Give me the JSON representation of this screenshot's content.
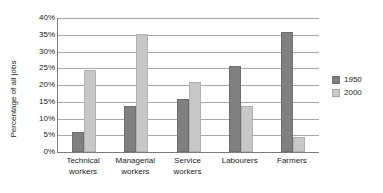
{
  "chart_data": {
    "type": "bar",
    "title": "",
    "subtitle": "",
    "xlabel": "",
    "ylabel": "Percentage of all jobs",
    "ylim": [
      0,
      40
    ],
    "ytick_labels": [
      "0%",
      "5%",
      "10%",
      "15%",
      "20%",
      "25%",
      "30%",
      "35%",
      "40%"
    ],
    "ytick_values": [
      0,
      5,
      10,
      15,
      20,
      25,
      30,
      35,
      40
    ],
    "grid": "horizontal",
    "legend_position": "right",
    "categories": [
      "Technical workers",
      "Managerial workers",
      "Service workers",
      "Labourers",
      "Farmers"
    ],
    "category_lines": [
      [
        "Technical",
        "workers"
      ],
      [
        "Managerial",
        "workers"
      ],
      [
        "Service",
        "workers"
      ],
      [
        "Labourers",
        ""
      ],
      [
        "Farmers",
        ""
      ]
    ],
    "series": [
      {
        "name": "1950",
        "color": "#808080",
        "values": [
          6.0,
          13.7,
          15.7,
          25.8,
          35.8
        ]
      },
      {
        "name": "2000",
        "color": "#c8c8c8",
        "values": [
          24.5,
          35.2,
          21.0,
          13.6,
          4.5
        ]
      }
    ]
  },
  "legend": {
    "items": [
      {
        "label": "1950"
      },
      {
        "label": "2000"
      }
    ]
  }
}
